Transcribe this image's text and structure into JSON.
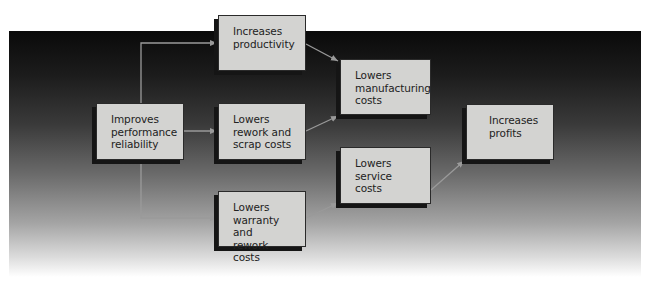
{
  "diagram": {
    "type": "flowchart",
    "background": {
      "gradient_top": "#0a0a0a",
      "gradient_bottom": "#ffffff"
    },
    "colors": {
      "node_fill": "#d3d3d1",
      "node_border": "#2a2a2a",
      "node_shadow": "#151515",
      "connector": "#9a9a9a",
      "text": "#222222"
    },
    "nodes": {
      "improves_reliability": {
        "label": "Improves\nperformance\nreliability"
      },
      "increases_productivity": {
        "label": "Increases\nproductivity"
      },
      "lowers_rework_scrap": {
        "label": "Lowers\nrework and\nscrap costs"
      },
      "lowers_warranty_rework": {
        "label": "Lowers\nwarranty and\nrework costs"
      },
      "lowers_manufacturing": {
        "label": "Lowers\nmanufacturing\ncosts"
      },
      "lowers_service": {
        "label": "Lowers\nservice costs"
      },
      "increases_profits": {
        "label": "Increases\nprofits"
      }
    },
    "edges": [
      {
        "from": "improves_reliability",
        "to": "increases_productivity"
      },
      {
        "from": "improves_reliability",
        "to": "lowers_rework_scrap"
      },
      {
        "from": "improves_reliability",
        "to": "lowers_warranty_rework"
      },
      {
        "from": "increases_productivity",
        "to": "lowers_manufacturing"
      },
      {
        "from": "lowers_rework_scrap",
        "to": "lowers_manufacturing"
      },
      {
        "from": "lowers_warranty_rework",
        "to": "lowers_service"
      },
      {
        "from": "lowers_service",
        "to": "increases_profits"
      }
    ]
  }
}
